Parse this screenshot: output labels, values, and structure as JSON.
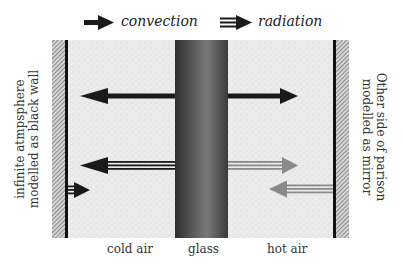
{
  "legend": {
    "items": [
      {
        "label": "convection",
        "icon": "solid-arrow-icon"
      },
      {
        "label": "radiation",
        "icon": "double-line-arrow-icon"
      }
    ]
  },
  "regions": {
    "left_label_line1": "infinite atmpsphere",
    "left_label_line2": "modelled as black wall",
    "right_label_line1": "Other side of parison",
    "right_label_line2": "modelled as mirror",
    "cold_air": "cold air",
    "glass": "glass",
    "hot_air": "hot air"
  },
  "colors": {
    "black_arrow": "#1a1a1a",
    "grey_arrow": "#8a8a8a",
    "air_fill": "#e9e9e9",
    "glass_dark": "#3a3a3a",
    "glass_mid": "#7a7a7a",
    "wall_line": "#111111",
    "hatch": "#6f6f6f"
  }
}
